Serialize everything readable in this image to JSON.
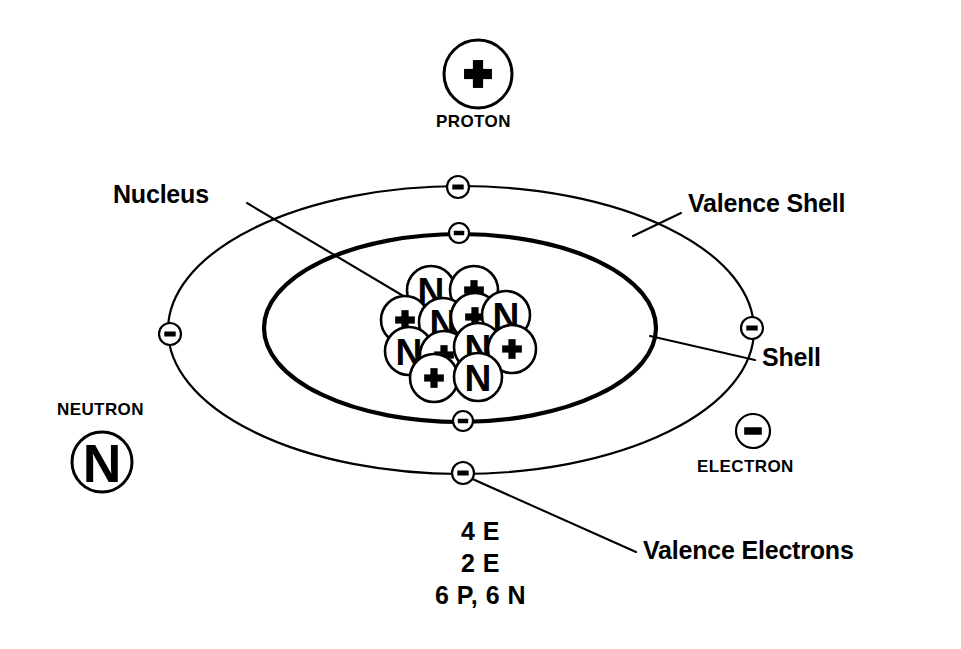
{
  "diagram": {
    "background_color": "#ffffff",
    "stroke_color": "#000000"
  },
  "legend": {
    "proton": {
      "label": "PROTON",
      "symbol": "+",
      "icon": "plus-circle-icon",
      "center": {
        "x": 478,
        "y": 74
      },
      "radius": 34,
      "label_position": "below"
    },
    "neutron": {
      "label": "NEUTRON",
      "symbol": "N",
      "icon": "neutron-circle-icon",
      "center": {
        "x": 102,
        "y": 462
      },
      "radius": 30,
      "label_position": "above"
    },
    "electron": {
      "label": "ELECTRON",
      "symbol": "–",
      "icon": "minus-circle-icon",
      "center": {
        "x": 753,
        "y": 431
      },
      "radius": 17,
      "label_position": "below"
    }
  },
  "callouts": [
    {
      "name": "nucleus",
      "text": "Nucleus",
      "text_x": 113,
      "text_y": 182,
      "leader": {
        "x1": 247,
        "y1": 203,
        "x2": 437,
        "y2": 316
      }
    },
    {
      "name": "valence-shell",
      "text": "Valence Shell",
      "text_x": 688,
      "text_y": 191,
      "leader": {
        "x1": 681,
        "y1": 213,
        "x2": 633,
        "y2": 236
      }
    },
    {
      "name": "shell",
      "text": "Shell",
      "text_x": 762,
      "text_y": 345,
      "leader": {
        "x1": 755,
        "y1": 360,
        "x2": 650,
        "y2": 336
      }
    },
    {
      "name": "valence-electrons",
      "text": "Valence Electrons",
      "text_x": 643,
      "text_y": 538,
      "leader": {
        "x1": 636,
        "y1": 552,
        "x2": 468,
        "y2": 477
      }
    }
  ],
  "shells": {
    "valence": {
      "name": "valence-shell",
      "cx": 461,
      "cy": 330,
      "rx": 293,
      "ry": 144,
      "stroke_width": 2.2,
      "electron_count": 4,
      "electrons": [
        {
          "x": 458,
          "y": 187
        },
        {
          "x": 170,
          "y": 334
        },
        {
          "x": 752,
          "y": 328
        },
        {
          "x": 463,
          "y": 473
        }
      ]
    },
    "inner": {
      "name": "inner-shell",
      "cx": 460,
      "cy": 328,
      "rx": 196,
      "ry": 94,
      "stroke_width": 4.2,
      "electron_count": 2,
      "electrons": [
        {
          "x": 459,
          "y": 233
        },
        {
          "x": 463,
          "y": 421
        }
      ]
    }
  },
  "nucleus": {
    "name": "nucleus-cluster",
    "proton_count": 6,
    "neutron_count": 6,
    "particle_radius": 24,
    "particles": [
      {
        "type": "neutron",
        "symbol": "N",
        "x": 431,
        "y": 290
      },
      {
        "type": "proton",
        "symbol": "+",
        "x": 474,
        "y": 290
      },
      {
        "type": "proton",
        "symbol": "+",
        "x": 405,
        "y": 320
      },
      {
        "type": "neutron",
        "symbol": "N",
        "x": 443,
        "y": 322
      },
      {
        "type": "proton",
        "symbol": "+",
        "x": 475,
        "y": 317
      },
      {
        "type": "neutron",
        "symbol": "N",
        "x": 506,
        "y": 315
      },
      {
        "type": "neutron",
        "symbol": "N",
        "x": 409,
        "y": 351
      },
      {
        "type": "proton",
        "symbol": "+",
        "x": 444,
        "y": 355
      },
      {
        "type": "neutron",
        "symbol": "N",
        "x": 478,
        "y": 347
      },
      {
        "type": "proton",
        "symbol": "+",
        "x": 512,
        "y": 349
      },
      {
        "type": "proton",
        "symbol": "+",
        "x": 434,
        "y": 378
      },
      {
        "type": "neutron",
        "symbol": "N",
        "x": 478,
        "y": 377
      }
    ]
  },
  "config_lines": {
    "name": "electron-configuration",
    "x": 461,
    "y": 519,
    "lines": [
      "4 E",
      "2 E",
      "6 P, 6 N"
    ]
  }
}
